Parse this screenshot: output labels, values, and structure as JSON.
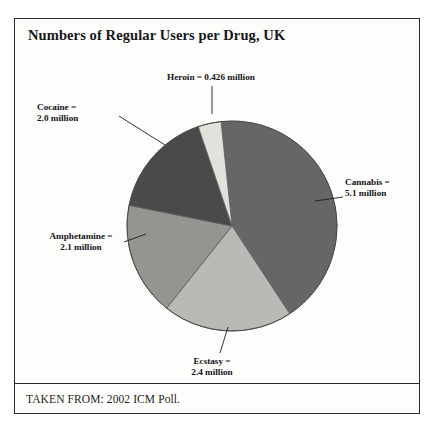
{
  "figure": {
    "title": "Numbers of Regular Users per Drug, UK",
    "source": "TAKEN FROM: 2002 ICM Poll."
  },
  "labels": {
    "heroin": {
      "line1": "Heroin = 0.426 million"
    },
    "cocaine": {
      "line1": "Cocaine =",
      "line2": "2.0 million"
    },
    "amphetamine": {
      "line1": "Amphetamine =",
      "line2": "2.1 million"
    },
    "cannabis": {
      "line1": "Cannabis =",
      "line2": "5.1 million"
    },
    "ecstasy": {
      "line1": "Ecstasy =",
      "line2": "2.4 million"
    }
  },
  "chart_data": {
    "type": "pie",
    "title": "Numbers of Regular Users per Drug, UK",
    "unit": "million regular users",
    "categories": [
      "Cannabis",
      "Ecstasy",
      "Amphetamine",
      "Cocaine",
      "Heroin"
    ],
    "values": [
      5.1,
      2.4,
      2.1,
      2.0,
      0.426
    ],
    "total": 12.026,
    "start_angle_deg": -6,
    "direction": "clockwise",
    "legend": "none-callout-labels",
    "grid": false,
    "slices": [
      {
        "name": "Cannabis",
        "value": 5.1,
        "label": "Cannabis = 5.1 million",
        "color": "#666666",
        "angle_deg": 152.7,
        "percent": 42.4
      },
      {
        "name": "Ecstasy",
        "value": 2.4,
        "label": "Ecstasy = 2.4 million",
        "color": "#b9b9b6",
        "angle_deg": 71.8,
        "percent": 20.0
      },
      {
        "name": "Amphetamine",
        "value": 2.1,
        "label": "Amphetamine = 2.1 million",
        "color": "#949491",
        "angle_deg": 62.9,
        "percent": 17.5
      },
      {
        "name": "Cocaine",
        "value": 2.0,
        "label": "Cocaine = 2.0 million",
        "color": "#4a4a4a",
        "angle_deg": 59.9,
        "percent": 16.6
      },
      {
        "name": "Heroin",
        "value": 0.426,
        "label": "Heroin = 0.426 million",
        "color": "#e2e2dd",
        "angle_deg": 12.8,
        "percent": 3.5
      }
    ]
  },
  "colors": {
    "border": "#2a2a2a",
    "text": "#131316",
    "background": "#fdfdfb"
  }
}
